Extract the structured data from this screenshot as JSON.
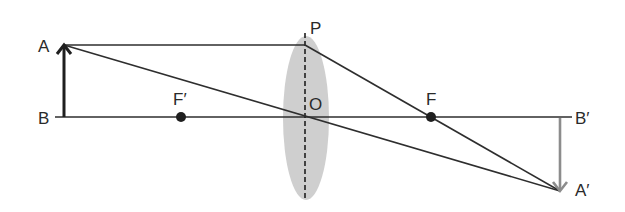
{
  "diagram": {
    "type": "convex-lens-ray-diagram",
    "colors": {
      "line": "#2e2e2e",
      "object_arrow": "#1f1f1f",
      "image_arrow": "#8c8c8c",
      "lens_fill": "#cfcfcf",
      "background": "#ffffff"
    },
    "labels": {
      "A": "A",
      "B": "B",
      "P": "P",
      "O": "O",
      "F_prime": "F′",
      "F": "F",
      "B_prime": "B′",
      "A_prime": "A′"
    },
    "points": {
      "A": [
        64,
        45
      ],
      "B": [
        64,
        117
      ],
      "P": [
        305,
        45
      ],
      "O": [
        305,
        117
      ],
      "F_prime": [
        181,
        117
      ],
      "F": [
        431,
        117
      ],
      "B_prime": [
        560,
        117
      ],
      "A_prime": [
        560,
        191
      ]
    },
    "elements": {
      "principal_axis": "horizontal line through B, O and B′",
      "lens": "biconvex lens at O with dashed vertical lens axis",
      "object": "upright arrow AB",
      "image": "inverted arrow B′A′",
      "rays": [
        "A → P (parallel to axis)",
        "P → F → A′",
        "A → O → A′"
      ]
    }
  }
}
